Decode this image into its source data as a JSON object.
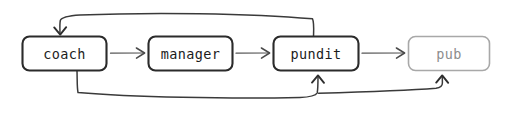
{
  "diagram": {
    "type": "flowchart",
    "orientation": "left-to-right",
    "style": "hand-drawn",
    "background_color": "#ffffff",
    "nodes": [
      {
        "id": "coach",
        "label": "coach",
        "shape": "rounded-rectangle",
        "state": "active",
        "stroke_color": "#2b2b2b",
        "text_color": "#1c1c1c",
        "x": 22,
        "y": 36,
        "w": 84,
        "h": 34
      },
      {
        "id": "manager",
        "label": "manager",
        "shape": "rounded-rectangle",
        "state": "active",
        "stroke_color": "#2b2b2b",
        "text_color": "#1c1c1c",
        "x": 148,
        "y": 36,
        "w": 84,
        "h": 34
      },
      {
        "id": "pundit",
        "label": "pundit",
        "shape": "rounded-rectangle",
        "state": "active",
        "stroke_color": "#2b2b2b",
        "text_color": "#1c1c1c",
        "x": 273,
        "y": 36,
        "w": 85,
        "h": 34
      },
      {
        "id": "pub",
        "label": "pub",
        "shape": "rounded-rectangle",
        "state": "muted",
        "stroke_color": "#a8a8a8",
        "text_color": "#8d8d8d",
        "x": 408,
        "y": 36,
        "w": 81,
        "h": 34
      }
    ],
    "edges": [
      {
        "id": "coach-to-manager",
        "from": "coach",
        "to": "manager",
        "kind": "forward",
        "arrow": "right"
      },
      {
        "id": "manager-to-pundit",
        "from": "manager",
        "to": "pundit",
        "kind": "forward",
        "arrow": "right"
      },
      {
        "id": "pundit-to-pub",
        "from": "pundit",
        "to": "pub",
        "kind": "forward",
        "arrow": "right"
      },
      {
        "id": "pundit-to-coach",
        "from": "pundit",
        "to": "coach",
        "kind": "feedback-top",
        "arrow": "down"
      },
      {
        "id": "coach-to-pundit",
        "from": "coach",
        "to": "pundit",
        "kind": "feedback-bottom",
        "arrow": "up"
      },
      {
        "id": "coach-to-pub",
        "from": "coach",
        "to": "pub",
        "kind": "feedback-bottom",
        "arrow": "up"
      }
    ]
  }
}
